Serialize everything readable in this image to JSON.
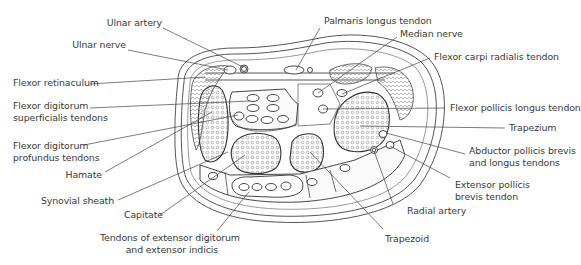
{
  "figure": {
    "labels_left": [
      {
        "id": "ulnar-artery",
        "text": "Ulnar artery"
      },
      {
        "id": "ulnar-nerve",
        "text": "Ulnar nerve"
      },
      {
        "id": "flexor-retinaculum",
        "text": "Flexor retinaculum"
      },
      {
        "id": "fds-tendons",
        "line1": "Flexor digitorum",
        "line2": "superficialis tendons"
      },
      {
        "id": "fdp-tendons",
        "line1": "Flexor digitorum",
        "line2": "profundus tendons"
      },
      {
        "id": "hamate",
        "text": "Hamate"
      },
      {
        "id": "synovial-sheath",
        "text": "Synovial sheath"
      },
      {
        "id": "capitate",
        "text": "Capitate"
      }
    ],
    "labels_right": [
      {
        "id": "palmaris-longus",
        "text": "Palmaris longus tendon"
      },
      {
        "id": "median-nerve",
        "text": "Median nerve"
      },
      {
        "id": "fcr-tendon",
        "text": "Flexor carpi radialis tendon"
      },
      {
        "id": "fpl-tendon",
        "text": "Flexor pollicis longus tendon"
      },
      {
        "id": "trapezium",
        "text": "Trapezium"
      },
      {
        "id": "apb-apl",
        "line1": "Abductor pollicis brevis",
        "line2": "and longus tendons"
      },
      {
        "id": "epb",
        "line1": "Extensor pollicis",
        "line2": "brevis tendon"
      },
      {
        "id": "radial-artery",
        "text": "Radial artery"
      },
      {
        "id": "trapezoid",
        "text": "Trapezoid"
      }
    ],
    "labels_bottom": [
      {
        "id": "extensor-tendons",
        "line1": "Tendons of extensor digitorum",
        "line2": "and extensor indicis"
      }
    ],
    "caption_partial": "Figure — (caption cut off at bottom edge)",
    "colors": {
      "line": "#444444",
      "text": "#3a3a3a",
      "background": "#ffffff",
      "fill_light": "#f4f4f4"
    }
  }
}
